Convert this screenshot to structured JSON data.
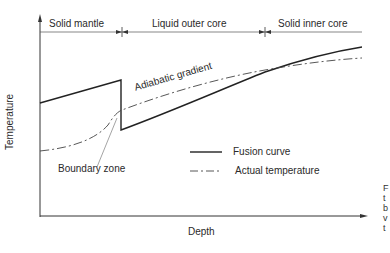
{
  "diagram": {
    "regions": [
      {
        "label": "Solid mantle"
      },
      {
        "label": "Liquid outer core"
      },
      {
        "label": "Solid inner core"
      }
    ],
    "axes": {
      "x_label": "Depth",
      "y_label": "Temperature"
    },
    "annotations": {
      "adiabatic": "Adiabatic gradient",
      "boundary": "Boundary zone"
    },
    "legend": [
      {
        "label": "Fusion curve",
        "style": "solid"
      },
      {
        "label": "Actual temperature",
        "style": "dash-dot"
      }
    ],
    "caption_fragments": [
      "F",
      "t",
      "b",
      "v",
      "t"
    ]
  }
}
